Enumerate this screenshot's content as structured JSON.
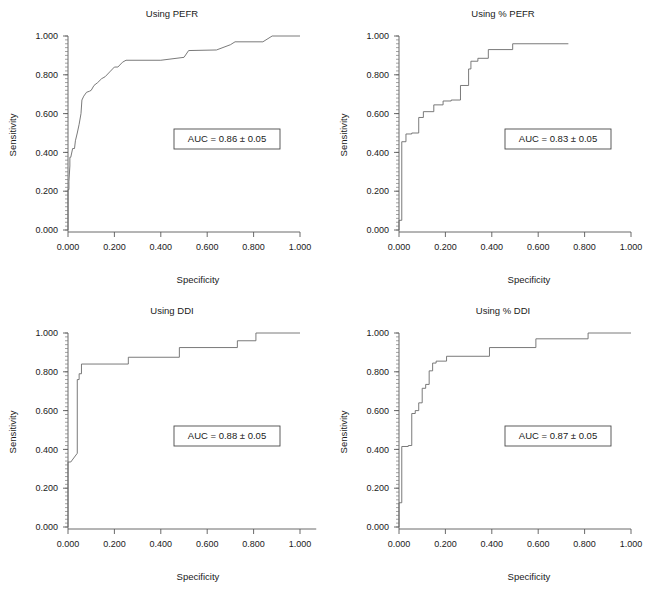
{
  "figure": {
    "panel_count": 4,
    "background_color": "#ffffff",
    "curve_color": "#6b6b6b",
    "axis_color": "#5a5a5a",
    "text_color": "#1a1a1a"
  },
  "panels": [
    {
      "key": "pefr",
      "position": "top-left",
      "title": "Using PEFR",
      "xlabel": "Specificity",
      "ylabel": "Sensitivity",
      "auc_text": "AUC = 0.86 ± 0.05",
      "auc_value": 0.86,
      "auc_se": 0.05,
      "xticks": [
        "0.000",
        "0.200",
        "0.400",
        "0.600",
        "0.800",
        "1.000"
      ],
      "yticks": [
        "0.000",
        "0.200",
        "0.400",
        "0.600",
        "0.800",
        "1.000"
      ],
      "xlim": [
        0.0,
        1.0
      ],
      "ylim": [
        0.0,
        1.0
      ],
      "x_axis_overrun": 0.0
    },
    {
      "key": "pct_pefr",
      "position": "top-right",
      "title": "Using % PEFR",
      "xlabel": "Specificity",
      "ylabel": "Sensitivity",
      "auc_text": "AUC = 0.83 ± 0.05",
      "auc_value": 0.83,
      "auc_se": 0.05,
      "xticks": [
        "0.000",
        "0.200",
        "0.400",
        "0.600",
        "0.800",
        "1.000"
      ],
      "yticks": [
        "0.000",
        "0.200",
        "0.400",
        "0.600",
        "0.800",
        "1.000"
      ],
      "xlim": [
        0.0,
        1.0
      ],
      "ylim": [
        0.0,
        1.0
      ],
      "x_axis_overrun": 0.0
    },
    {
      "key": "ddi",
      "position": "bottom-left",
      "title": "Using DDI",
      "xlabel": "Specificity",
      "ylabel": "Sensitivity",
      "auc_text": "AUC = 0.88 ± 0.05",
      "auc_value": 0.88,
      "auc_se": 0.05,
      "xticks": [
        "0.000",
        "0.200",
        "0.400",
        "0.600",
        "0.800",
        "1.000"
      ],
      "yticks": [
        "0.000",
        "0.200",
        "0.400",
        "0.600",
        "0.800",
        "1.000"
      ],
      "xlim": [
        0.0,
        1.0
      ],
      "ylim": [
        0.0,
        1.0
      ],
      "x_axis_overrun": 0.07
    },
    {
      "key": "pct_ddi",
      "position": "bottom-right",
      "title": "Using % DDI",
      "xlabel": "Specificity",
      "ylabel": "Sensitivity",
      "auc_text": "AUC = 0.87 ± 0.05",
      "auc_value": 0.87,
      "auc_se": 0.05,
      "xticks": [
        "0.000",
        "0.200",
        "0.400",
        "0.600",
        "0.800",
        "1.000"
      ],
      "yticks": [
        "0.000",
        "0.200",
        "0.400",
        "0.600",
        "0.800",
        "1.000"
      ],
      "xlim": [
        0.0,
        1.0
      ],
      "ylim": [
        0.0,
        1.0
      ],
      "x_axis_overrun": 0.0
    }
  ],
  "chart_data": [
    {
      "type": "line",
      "title": "Using PEFR",
      "xlabel": "Specificity",
      "ylabel": "Sensitivity",
      "xlim": [
        0.0,
        1.0
      ],
      "ylim": [
        0.0,
        1.0
      ],
      "grid": false,
      "legend": "none",
      "annotations": [
        "AUC = 0.86 ± 0.05"
      ],
      "series": [
        {
          "name": "ROC PEFR",
          "x": [
            0.0,
            0.0,
            0.0,
            0.004,
            0.004,
            0.008,
            0.008,
            0.012,
            0.02,
            0.028,
            0.032,
            0.04,
            0.048,
            0.056,
            0.06,
            0.068,
            0.08,
            0.092,
            0.1,
            0.112,
            0.128,
            0.145,
            0.16,
            0.18,
            0.2,
            0.215,
            0.235,
            0.25,
            0.4,
            0.5,
            0.52,
            0.64,
            0.7,
            0.72,
            0.84,
            0.88,
            1.0
          ],
          "y": [
            0.0,
            0.12,
            0.208,
            0.208,
            0.25,
            0.33,
            0.375,
            0.375,
            0.42,
            0.42,
            0.46,
            0.5,
            0.545,
            0.6,
            0.67,
            0.69,
            0.71,
            0.715,
            0.72,
            0.745,
            0.76,
            0.78,
            0.79,
            0.815,
            0.84,
            0.84,
            0.865,
            0.875,
            0.875,
            0.89,
            0.925,
            0.928,
            0.955,
            0.97,
            0.97,
            1.0,
            1.0
          ]
        }
      ]
    },
    {
      "type": "line",
      "title": "Using % PEFR",
      "xlabel": "Specificity",
      "ylabel": "Sensitivity",
      "xlim": [
        0.0,
        1.0
      ],
      "ylim": [
        0.0,
        1.0
      ],
      "grid": false,
      "legend": "none",
      "annotations": [
        "AUC = 0.83 ± 0.05"
      ],
      "series": [
        {
          "name": "ROC % PEFR",
          "x": [
            0.0,
            0.0,
            0.012,
            0.012,
            0.03,
            0.03,
            0.055,
            0.055,
            0.085,
            0.085,
            0.105,
            0.105,
            0.15,
            0.15,
            0.19,
            0.19,
            0.225,
            0.225,
            0.265,
            0.265,
            0.3,
            0.3,
            0.31,
            0.31,
            0.34,
            0.34,
            0.385,
            0.385,
            0.49,
            0.49,
            0.73
          ],
          "y": [
            0.0,
            0.05,
            0.05,
            0.455,
            0.455,
            0.495,
            0.495,
            0.5,
            0.5,
            0.58,
            0.58,
            0.61,
            0.61,
            0.645,
            0.645,
            0.665,
            0.665,
            0.67,
            0.67,
            0.745,
            0.745,
            0.83,
            0.83,
            0.87,
            0.87,
            0.885,
            0.885,
            0.93,
            0.93,
            0.96,
            0.96
          ]
        }
      ]
    },
    {
      "type": "line",
      "title": "Using DDI",
      "xlabel": "Specificity",
      "ylabel": "Sensitivity",
      "xlim": [
        0.0,
        1.0
      ],
      "ylim": [
        0.0,
        1.0
      ],
      "grid": false,
      "legend": "none",
      "annotations": [
        "AUC = 0.88 ± 0.05"
      ],
      "series": [
        {
          "name": "ROC DDI",
          "x": [
            0.0,
            0.0,
            0.0,
            0.012,
            0.04,
            0.04,
            0.048,
            0.048,
            0.058,
            0.058,
            0.26,
            0.26,
            0.48,
            0.48,
            0.73,
            0.73,
            0.81,
            0.81,
            1.0
          ],
          "y": [
            0.0,
            0.25,
            0.335,
            0.335,
            0.38,
            0.76,
            0.76,
            0.79,
            0.79,
            0.84,
            0.84,
            0.875,
            0.875,
            0.925,
            0.925,
            0.96,
            0.96,
            1.0,
            1.0
          ]
        }
      ]
    },
    {
      "type": "line",
      "title": "Using % DDI",
      "xlabel": "Specificity",
      "ylabel": "Sensitivity",
      "xlim": [
        0.0,
        1.0
      ],
      "ylim": [
        0.0,
        1.0
      ],
      "grid": false,
      "legend": "none",
      "annotations": [
        "AUC = 0.87 ± 0.05"
      ],
      "series": [
        {
          "name": "ROC % DDI",
          "x": [
            0.0,
            0.0,
            0.012,
            0.012,
            0.04,
            0.04,
            0.055,
            0.055,
            0.07,
            0.07,
            0.085,
            0.085,
            0.1,
            0.1,
            0.115,
            0.115,
            0.13,
            0.13,
            0.145,
            0.145,
            0.16,
            0.16,
            0.205,
            0.205,
            0.39,
            0.39,
            0.59,
            0.59,
            0.815,
            0.815,
            1.0
          ],
          "y": [
            0.0,
            0.125,
            0.125,
            0.415,
            0.415,
            0.42,
            0.42,
            0.585,
            0.585,
            0.6,
            0.6,
            0.64,
            0.64,
            0.715,
            0.715,
            0.735,
            0.735,
            0.805,
            0.805,
            0.845,
            0.845,
            0.855,
            0.855,
            0.88,
            0.88,
            0.925,
            0.925,
            0.97,
            0.97,
            1.0,
            1.0
          ]
        }
      ]
    }
  ]
}
